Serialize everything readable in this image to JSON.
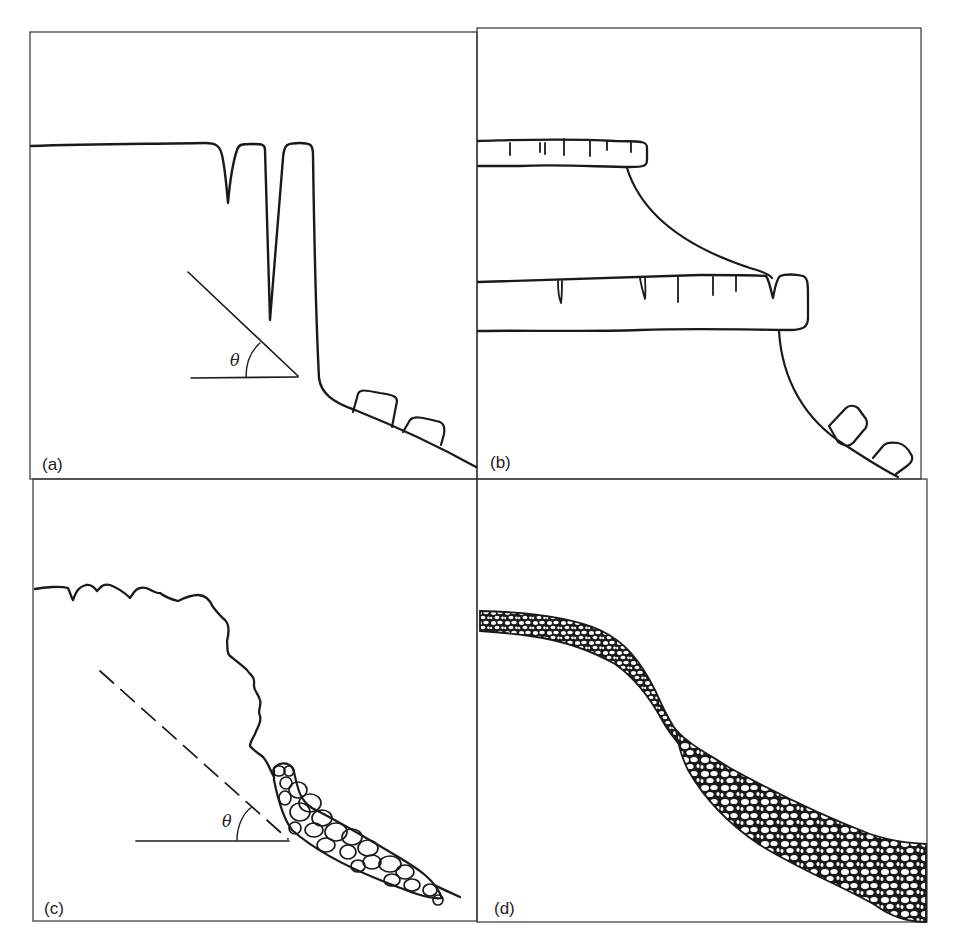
{
  "figure": {
    "type": "four-panel slope diagram",
    "frame_color": "#333333",
    "line_color": "#1a1a1a",
    "background": "#ffffff",
    "panels": [
      {
        "id": "a",
        "label": "(a)",
        "angle_symbol": "θ",
        "depicts": "vertical cliff with tension cracks, talus blocks at base, slope angle indicator"
      },
      {
        "id": "b",
        "label": "(b)",
        "angle_symbol": "",
        "depicts": "stepped caprock ledges with joints, concave slopes, fallen blocks at base"
      },
      {
        "id": "c",
        "label": "(c)",
        "angle_symbol": "θ",
        "depicts": "irregular rock face with talus/scree cone and dashed slope-angle line"
      },
      {
        "id": "d",
        "label": "(d)",
        "angle_symbol": "",
        "depicts": "soil-mantled convexo-concave slope with regolith layer of clasts"
      }
    ]
  }
}
